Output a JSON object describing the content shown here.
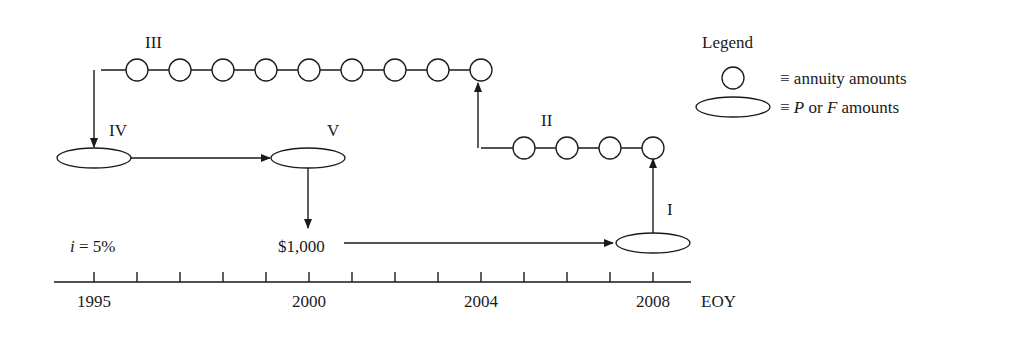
{
  "diagram": {
    "interest_label": "i = 5%",
    "interest_var": "i",
    "interest_rest": " = 5%",
    "amount_label": "$1,000",
    "axis_unit": "EOY",
    "year_labels": [
      {
        "year": "1995",
        "tick_index": 0
      },
      {
        "year": "2000",
        "tick_index": 5
      },
      {
        "year": "2004",
        "tick_index": 9
      },
      {
        "year": "2008",
        "tick_index": 13
      }
    ],
    "tick_count": 14,
    "steps": [
      {
        "id": "I",
        "label": "I",
        "description": "Compound $1,000 from 2000 to future amount at 2008"
      },
      {
        "id": "II",
        "label": "II",
        "description": "Annuity 2005-2008 (4 payments) ending at 2008"
      },
      {
        "id": "III",
        "label": "III",
        "description": "Annuity 1996-2004 (9 payments)"
      },
      {
        "id": "IV",
        "label": "IV",
        "description": "Present amount at 1995"
      },
      {
        "id": "V",
        "label": "V",
        "description": "Amount moved to 2000"
      }
    ],
    "annuity_III_count": 9,
    "annuity_II_count": 4
  },
  "legend": {
    "title": "Legend",
    "items": [
      {
        "symbol": "circle",
        "text": "≡ annuity amounts"
      },
      {
        "symbol": "ellipse",
        "prefix": "≡ ",
        "p": "P",
        "mid": " or ",
        "f": "F",
        "suffix": " amounts"
      }
    ]
  },
  "colors": {
    "ink": "#1a1a1a",
    "background": "#ffffff"
  }
}
